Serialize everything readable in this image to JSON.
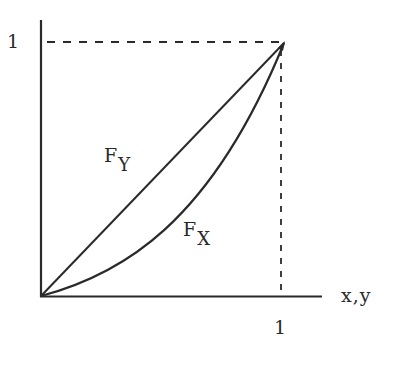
{
  "diagram": {
    "type": "cumulative distribution comparison",
    "y_axis": {
      "tick_label": "1"
    },
    "x_axis": {
      "label": "x,y",
      "tick_label": "1"
    },
    "curves": [
      {
        "name": "F_Y",
        "label_main": "F",
        "label_sub": "Y",
        "shape": "straight line from origin to (1,1)"
      },
      {
        "name": "F_X",
        "label_main": "F",
        "label_sub": "X",
        "shape": "convex curve from origin to (1,1), lying below F_Y"
      }
    ],
    "guides": {
      "horizontal_dashed_at": "y = 1",
      "vertical_dashed_at": "x = 1"
    },
    "colors": {
      "ink": "#2a2a2a",
      "background": "#ffffff"
    }
  }
}
